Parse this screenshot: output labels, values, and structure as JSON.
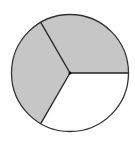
{
  "figure": {
    "total_parts": 3,
    "shaded_parts": 2,
    "shaded_fraction": "2/3",
    "colors": {
      "shaded": "#c6c6c6",
      "unshaded": "#ffffff",
      "stroke": "#333333",
      "background": "#ffffff"
    },
    "sectors": [
      {
        "id": "upper",
        "start_deg": 0,
        "end_deg": 120,
        "shaded": true
      },
      {
        "id": "left",
        "start_deg": 120,
        "end_deg": 240,
        "shaded": true
      },
      {
        "id": "lower-right",
        "start_deg": 240,
        "end_deg": 360,
        "shaded": false
      }
    ]
  }
}
